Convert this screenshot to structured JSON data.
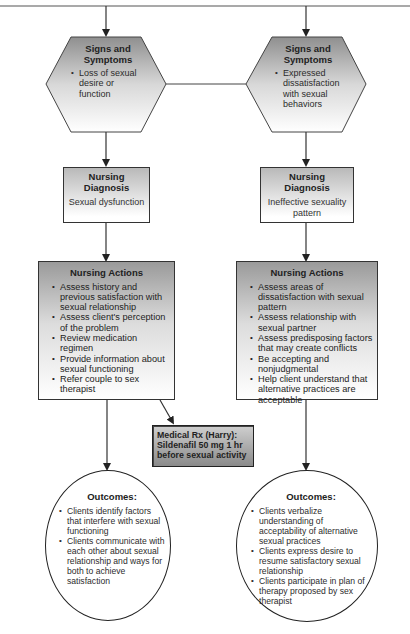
{
  "diagram": {
    "left_branch": {
      "signs": {
        "title": "Signs and Symptoms",
        "items": [
          "Loss of sexual desire or function"
        ]
      },
      "diagnosis": {
        "title": "Nursing Diagnosis",
        "text": "Sexual dysfunction"
      },
      "actions": {
        "title": "Nursing Actions",
        "items": [
          "Assess history and previous satisfaction with sexual relationship",
          "Assess client's perception of the problem",
          "Review medication regimen",
          "Provide information about sexual functioning",
          "Refer couple to sex therapist"
        ]
      },
      "outcomes": {
        "title": "Outcomes:",
        "items": [
          "Clients identify factors that interfere with sexual functioning",
          "Clients communicate with each other about sexual relationship and ways for both to achieve satisfaction"
        ]
      }
    },
    "right_branch": {
      "signs": {
        "title": "Signs and Symptoms",
        "items": [
          "Expressed dissatisfaction with sexual behaviors"
        ]
      },
      "diagnosis": {
        "title": "Nursing Diagnosis",
        "text": "Ineffective sexuality pattern"
      },
      "actions": {
        "title": "Nursing Actions",
        "items": [
          "Assess areas of dissatisfaction with sexual pattern",
          "Assess relationship with sexual partner",
          "Assess predisposing factors that may create conflicts",
          "Be accepting and nonjudgmental",
          "Help client understand that alternative practices are acceptable"
        ]
      },
      "outcomes": {
        "title": "Outcomes:",
        "items": [
          "Clients verbalize understanding of acceptability of alternative sexual practices",
          "Clients express desire to resume satisfactory sexual relationship",
          "Clients participate in plan of therapy proposed by sex therapist"
        ]
      }
    },
    "medical_rx": {
      "line1": "Medical Rx (Harry):",
      "line2": "Sildenafil 50 mg 1 hr",
      "line3": "before sexual activity"
    },
    "colors": {
      "line": "#333333",
      "box_gradient_top": "#9a9a9a",
      "box_gradient_bottom": "#ffffff",
      "rx_fill": "#a8a8a8"
    }
  }
}
